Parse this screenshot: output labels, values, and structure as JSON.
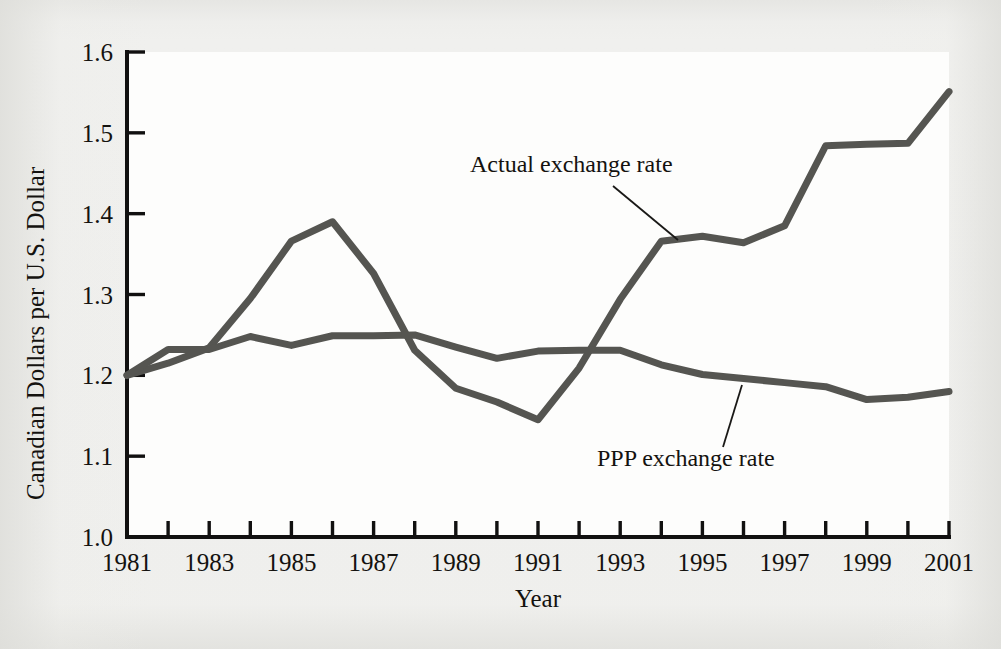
{
  "figure": {
    "background_color": "#efefed",
    "plot_background_color": "#fdfdfc",
    "line_color": "#555551",
    "axis_color": "#111010"
  },
  "chart_data": {
    "type": "line",
    "title": "",
    "xlabel": "Year",
    "ylabel": "Canadian Dollars per U.S. Dollar",
    "xlim": [
      1981,
      2001
    ],
    "ylim": [
      1.0,
      1.6
    ],
    "grid": false,
    "legend_position": "inline-annotations",
    "x": [
      1981,
      1982,
      1983,
      1984,
      1985,
      1986,
      1987,
      1988,
      1989,
      1990,
      1991,
      1992,
      1993,
      1994,
      1995,
      1996,
      1997,
      1998,
      1999,
      2000,
      2001
    ],
    "xtick_labels": [
      "1981",
      "1983",
      "1985",
      "1987",
      "1989",
      "1991",
      "1993",
      "1995",
      "1997",
      "1999",
      "2001"
    ],
    "xtick_values": [
      1981,
      1983,
      1985,
      1987,
      1989,
      1991,
      1993,
      1995,
      1997,
      1999,
      2001
    ],
    "xtick_minor_values": [
      1982,
      1984,
      1986,
      1988,
      1990,
      1992,
      1994,
      1996,
      1998,
      2000
    ],
    "ytick_labels": [
      "1.0",
      "1.1",
      "1.2",
      "1.3",
      "1.4",
      "1.5",
      "1.6"
    ],
    "ytick_values": [
      1.0,
      1.1,
      1.2,
      1.3,
      1.4,
      1.5,
      1.6
    ],
    "series": [
      {
        "name": "Actual exchange rate",
        "color": "#555551",
        "values": [
          1.2,
          1.215,
          1.234,
          1.295,
          1.366,
          1.39,
          1.326,
          1.231,
          1.184,
          1.167,
          1.145,
          1.209,
          1.294,
          1.366,
          1.372,
          1.364,
          1.385,
          1.484,
          1.486,
          1.487,
          1.551
        ]
      },
      {
        "name": "PPP exchange rate",
        "color": "#555551",
        "values": [
          1.2,
          1.232,
          1.232,
          1.248,
          1.237,
          1.249,
          1.249,
          1.25,
          1.235,
          1.221,
          1.23,
          1.231,
          1.231,
          1.213,
          1.201,
          1.196,
          1.191,
          1.186,
          1.17,
          1.173,
          1.18
        ]
      }
    ],
    "annotations": [
      {
        "text": "Actual exchange rate",
        "text_x": 470,
        "text_y": 172,
        "leader_from_x": 613,
        "leader_from_y": 186,
        "leader_to_x": 678,
        "leader_to_y": 240
      },
      {
        "text": "PPP exchange rate",
        "text_x": 597,
        "text_y": 466,
        "leader_from_x": 723,
        "leader_from_y": 447,
        "leader_to_x": 742,
        "leader_to_y": 385
      }
    ]
  }
}
